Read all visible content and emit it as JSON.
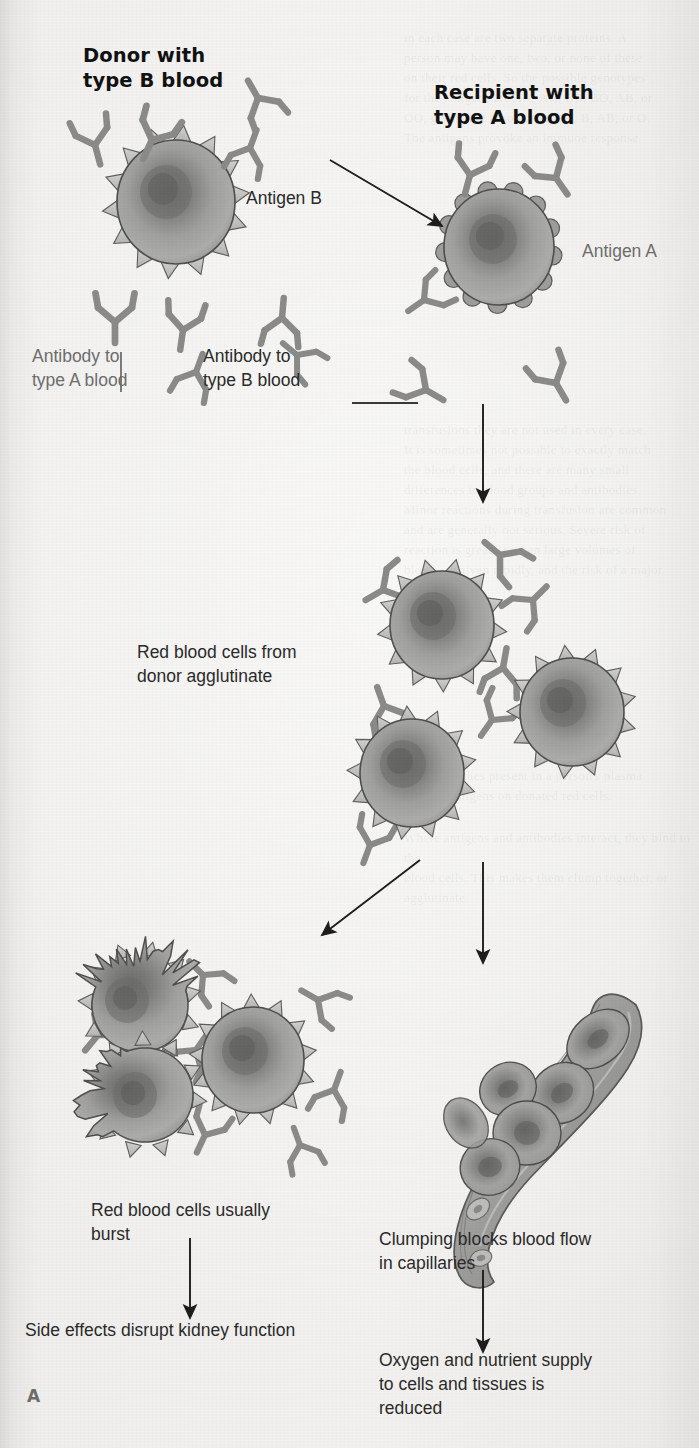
{
  "figure": {
    "panel_letter": "A",
    "topic": "Transfusion reaction: type B donor blood into type A recipient"
  },
  "labels": {
    "donor_title": "Donor with\ntype B blood",
    "recipient_title": "Recipient with\ntype A blood",
    "antigen_b": "Antigen B",
    "antigen_a": "Antigen A",
    "antibody_to_a": "Antibody to\ntype A blood",
    "antibody_to_b": "Antibody to\ntype B blood",
    "agglutinate": "Red blood cells from\ndonor agglutinate",
    "burst": "Red blood cells usually\nburst",
    "kidney": "Side effects disrupt kidney function",
    "clumping": "Clumping blocks blood flow\nin capillaries",
    "oxygen": "Oxygen and nutrient supply\nto cells and tissues is\nreduced"
  },
  "icons": {
    "donor_cell": "spiked-red-blood-cell-icon",
    "recipient_cell": "bumpy-red-blood-cell-icon",
    "antibody": "y-shaped-antibody-icon",
    "capillary": "capillary-tube-icon",
    "burst_cell": "ruptured-red-blood-cell-icon",
    "arrow": "arrow-icon"
  },
  "colors": {
    "paper": "#f2f1ef",
    "cell_fill": "#9a9a99",
    "cell_dark_center": "#5f5f5f",
    "cell_outline": "#4a4a4a",
    "spike_fill": "#c9c9c7",
    "antibody_stroke": "#8b8b8a",
    "arrow_stroke": "#1d1d1d",
    "text_dark": "#2b2b2b",
    "text_gray": "#6e6e6e",
    "capillary_fill": "#a3a3a1"
  },
  "bleed_text": {
    "top_right": "in each case are two separate proteins. A\nperson may have one, two, or none of these\non their red cells. So the possible genotypes\nfor the antigens are AA, AO, BB, BO, AB, or\nOO, giving the blood groups A, B, AB, or O.\nThe antigens provoke an immune response",
    "mid_right": "transfusions they are not used in every case.\nIt is sometimes not possible to exactly match\nthe blood cells, and there are many small\ndifferences in blood groups and antibodies.\nMinor reactions during transfusion are common\nand are generally not serious. Severe risk of\nreaction is greatest when large volumes of\nblood are given rapidly, and the risk of a major",
    "lower_right": "The antibodies present in a person's plasma\nreact to antigens on donated red cells.",
    "lower_right2": "Where antigens and antibodies interact, they bind to the\nblood cells. This makes them clump together, or agglutinate."
  },
  "arrows": [
    {
      "name": "donor-to-recipient",
      "from": [
        330,
        160
      ],
      "to": [
        442,
        226
      ]
    },
    {
      "name": "recipient-to-agglutinate",
      "from": [
        483,
        404
      ],
      "to": [
        483,
        502
      ]
    },
    {
      "name": "agglutinate-to-burst",
      "from": [
        420,
        860
      ],
      "to": [
        322,
        935
      ]
    },
    {
      "name": "agglutinate-to-capillary",
      "from": [
        483,
        862
      ],
      "to": [
        483,
        963
      ]
    },
    {
      "name": "burst-to-kidney",
      "from": [
        190,
        1238
      ],
      "to": [
        190,
        1318
      ]
    },
    {
      "name": "clumping-to-oxygen",
      "from": [
        483,
        1270
      ],
      "to": [
        483,
        1352
      ]
    }
  ]
}
